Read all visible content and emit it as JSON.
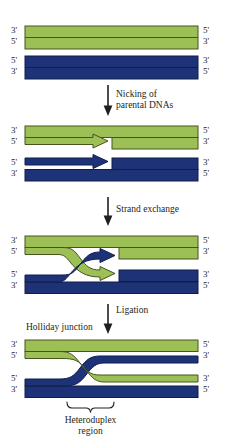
{
  "figure": {
    "title_text": "Holliday junction model of homologous recombination",
    "colors": {
      "green_strand": "#9cc055",
      "green_outline": "#4a5a22",
      "blue_strand": "#1e3377",
      "blue_outline": "#0f1c45",
      "background": "#ffffff",
      "text": "#231f20",
      "arrow": "#231f20"
    }
  },
  "stages": [
    {
      "id": "stage-1-parental-dnas",
      "name": "parental duplexes",
      "green_duplex": {
        "left_top": "3'",
        "left_bottom": "5'",
        "right_top": "5'",
        "right_bottom": "3'"
      },
      "blue_duplex": {
        "left_top": "5'",
        "left_bottom": "3'",
        "right_top": "3'",
        "right_bottom": "5'"
      }
    },
    {
      "id": "stage-2-nicked-dnas",
      "name": "nicked duplexes",
      "green_duplex": {
        "left_top": "3'",
        "left_bottom": "5'",
        "right_top": "5'",
        "right_bottom": "3'"
      },
      "blue_duplex": {
        "left_top": "5'",
        "left_bottom": "3'",
        "right_top": "3'",
        "right_bottom": "5'"
      }
    },
    {
      "id": "stage-3-strand-exchange",
      "name": "strand exchange intermediate",
      "green_duplex": {
        "left_top": "3'",
        "left_bottom": "5'",
        "right_top": "5'",
        "right_bottom": "3'"
      },
      "blue_duplex": {
        "left_top": "5'",
        "left_bottom": "3'",
        "right_top": "3'",
        "right_bottom": "5'"
      }
    },
    {
      "id": "stage-4-holliday-junction",
      "name": "holliday junction",
      "green_duplex": {
        "left_top": "3'",
        "left_bottom": "5'",
        "right_top": "5'",
        "right_bottom": "3'"
      },
      "blue_duplex": {
        "left_top": "5'",
        "left_bottom": "3'",
        "right_top": "3'",
        "right_bottom": "5'"
      }
    }
  ],
  "steps": [
    {
      "id": "step-nicking",
      "line1": "Nicking of",
      "line2": "parental DNAs"
    },
    {
      "id": "step-strand-exchange",
      "line1": "Strand exchange",
      "line2": ""
    },
    {
      "id": "step-ligation",
      "line1": "Ligation",
      "line2": ""
    }
  ],
  "annotations": {
    "holliday_junction_label": "Holliday junction",
    "heteroduplex_line1": "Heteroduplex",
    "heteroduplex_line2": "region"
  }
}
